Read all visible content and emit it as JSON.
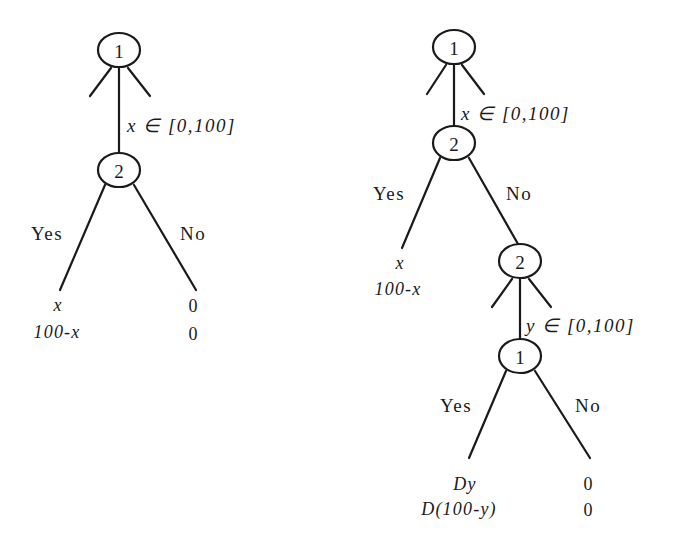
{
  "left_tree": {
    "nodes": [
      {
        "id": "L1",
        "player": "1"
      },
      {
        "id": "L2",
        "player": "2"
      }
    ],
    "offer_label": "x ∈ [0,100]",
    "actions": {
      "yes": "Yes",
      "no": "No"
    },
    "payoffs": {
      "yes": {
        "player1": "x",
        "player2": "100-x"
      },
      "no": {
        "player1": "0",
        "player2": "0"
      }
    }
  },
  "right_tree": {
    "nodes": [
      {
        "id": "R1",
        "player": "1"
      },
      {
        "id": "R2",
        "player": "2"
      },
      {
        "id": "R3",
        "player": "2"
      },
      {
        "id": "R4",
        "player": "1"
      }
    ],
    "offer_label_1": "x ∈ [0,100]",
    "offer_label_2": "y ∈ [0,100]",
    "actions_round1": {
      "yes": "Yes",
      "no": "No"
    },
    "actions_round2": {
      "yes": "Yes",
      "no": "No"
    },
    "payoffs_round1_yes": {
      "player1": "x",
      "player2": "100-x"
    },
    "payoffs_round2_yes": {
      "player1": "Dy",
      "player2": "D(100-y)"
    },
    "payoffs_round2_no": {
      "player1": "0",
      "player2": "0"
    }
  }
}
